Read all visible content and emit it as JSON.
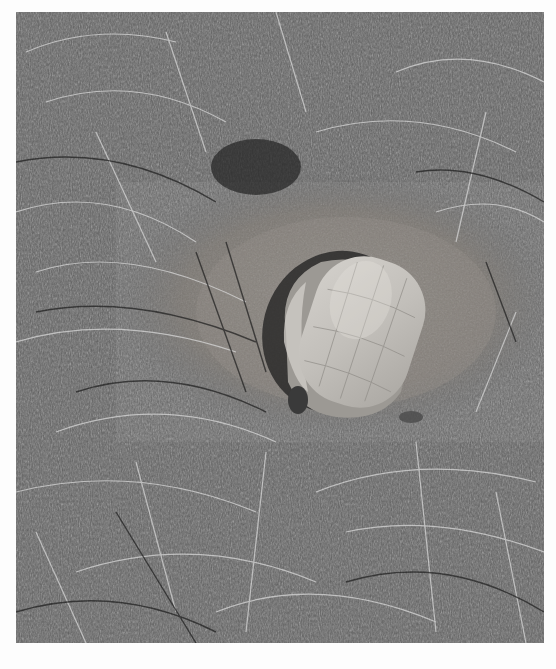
{
  "photo": {
    "subject": "turtle in grass",
    "mode": "black-and-white",
    "colors": {
      "grass_dark": "#2a2a2a",
      "grass_mid": "#6a6a6a",
      "grass_light": "#c8c8c8",
      "soil": "#8a8580",
      "shell": "#bdbab5",
      "shell_highlight": "#d6d3ce",
      "shadow": "#1e1e1e"
    }
  }
}
